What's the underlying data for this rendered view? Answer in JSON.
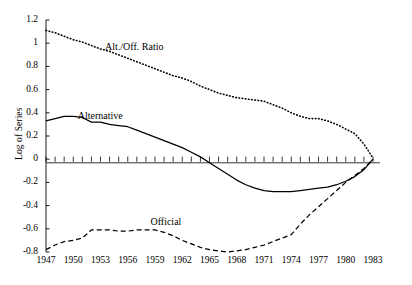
{
  "chart_data": {
    "type": "line",
    "title": "",
    "xlabel": "",
    "ylabel": "Log of Series",
    "xlim": [
      1947,
      1983
    ],
    "ylim": [
      -0.8,
      1.2
    ],
    "grid": false,
    "legend_position": "inline-annotations",
    "y_ticks": [
      "1.2",
      "1",
      "0.8",
      "0.6",
      "0.4",
      "0.2",
      "0",
      "-0.2",
      "-0.4",
      "-0.6",
      "-0.8"
    ],
    "y_tick_values": [
      1.2,
      1.0,
      0.8,
      0.6,
      0.4,
      0.2,
      0,
      -0.2,
      -0.4,
      -0.6,
      -0.8
    ],
    "x_ticks": [
      "1947",
      "1950",
      "1953",
      "1956",
      "1959",
      "1962",
      "1965",
      "1968",
      "1971",
      "1974",
      "1977",
      "1980",
      "1983"
    ],
    "x_tick_values": [
      1947,
      1950,
      1953,
      1956,
      1959,
      1962,
      1965,
      1968,
      1971,
      1974,
      1977,
      1980,
      1983
    ],
    "x": [
      1947,
      1948,
      1949,
      1950,
      1951,
      1952,
      1953,
      1954,
      1955,
      1956,
      1957,
      1958,
      1959,
      1960,
      1961,
      1962,
      1963,
      1964,
      1965,
      1966,
      1967,
      1968,
      1969,
      1970,
      1971,
      1972,
      1973,
      1974,
      1975,
      1976,
      1977,
      1978,
      1979,
      1980,
      1981,
      1982,
      1983
    ],
    "annotations": [
      {
        "text": "Alt./Off. Ratio",
        "series": "Alt./Off. Ratio",
        "x": 1953.5,
        "y": 0.96
      },
      {
        "text": "Alternative",
        "series": "Alternative",
        "x": 1950.5,
        "y": 0.36
      },
      {
        "text": "Official",
        "series": "Official",
        "x": 1958.5,
        "y": -0.55
      }
    ],
    "series": [
      {
        "name": "Alt./Off. Ratio",
        "style": "dotted",
        "color": "#000000",
        "values": [
          1.11,
          1.09,
          1.06,
          1.03,
          1.01,
          0.98,
          0.95,
          0.93,
          0.9,
          0.87,
          0.84,
          0.81,
          0.78,
          0.75,
          0.72,
          0.7,
          0.67,
          0.63,
          0.6,
          0.57,
          0.55,
          0.53,
          0.52,
          0.51,
          0.5,
          0.47,
          0.44,
          0.4,
          0.37,
          0.35,
          0.35,
          0.33,
          0.3,
          0.26,
          0.22,
          0.13,
          0.01
        ]
      },
      {
        "name": "Alternative",
        "style": "solid",
        "color": "#000000",
        "values": [
          0.33,
          0.35,
          0.37,
          0.37,
          0.36,
          0.32,
          0.32,
          0.3,
          0.29,
          0.28,
          0.25,
          0.22,
          0.19,
          0.16,
          0.13,
          0.1,
          0.06,
          0.02,
          -0.03,
          -0.08,
          -0.13,
          -0.18,
          -0.22,
          -0.25,
          -0.27,
          -0.28,
          -0.28,
          -0.28,
          -0.27,
          -0.26,
          -0.25,
          -0.24,
          -0.22,
          -0.19,
          -0.15,
          -0.09,
          0.0
        ]
      },
      {
        "name": "Official",
        "style": "dashed",
        "color": "#000000",
        "values": [
          -0.78,
          -0.74,
          -0.71,
          -0.7,
          -0.68,
          -0.61,
          -0.61,
          -0.61,
          -0.62,
          -0.62,
          -0.61,
          -0.61,
          -0.61,
          -0.63,
          -0.66,
          -0.7,
          -0.73,
          -0.76,
          -0.78,
          -0.79,
          -0.8,
          -0.79,
          -0.78,
          -0.76,
          -0.74,
          -0.71,
          -0.68,
          -0.65,
          -0.56,
          -0.48,
          -0.41,
          -0.34,
          -0.27,
          -0.2,
          -0.14,
          -0.08,
          0.0
        ]
      }
    ]
  }
}
